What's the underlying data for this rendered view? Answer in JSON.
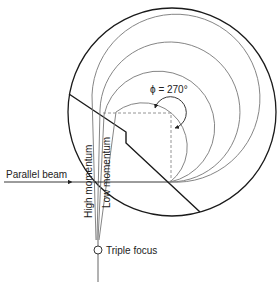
{
  "diagram": {
    "labels": {
      "angle": "ϕ = 270°",
      "parallel_beam": "Parallel beam",
      "high_momentum": "High momentum",
      "low_momentum": "Low momentum",
      "focus": "Triple focus"
    },
    "colors": {
      "outline": "#1a1a1a",
      "trajectory": "#777777",
      "dashed": "#888888",
      "text": "#222222"
    }
  }
}
